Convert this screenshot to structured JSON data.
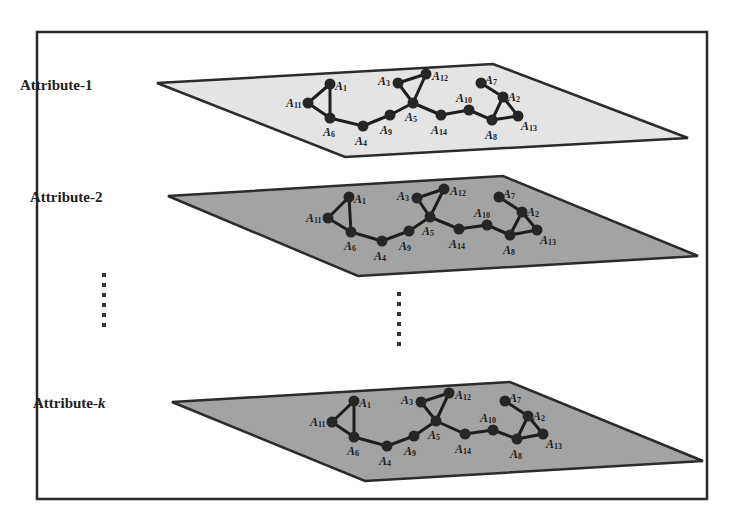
{
  "diagram": {
    "frame": {
      "x": 37,
      "y": 32,
      "w": 670,
      "h": 467
    },
    "colors": {
      "frame_stroke": "#2a2a2a",
      "plane_light": "#e4e4e4",
      "plane_dark": "#a3a3a3",
      "node": "#262626",
      "edge": "#1e1e1e"
    },
    "edges": [
      [
        "A1",
        "A11"
      ],
      [
        "A1",
        "A6"
      ],
      [
        "A11",
        "A6"
      ],
      [
        "A6",
        "A4"
      ],
      [
        "A4",
        "A9"
      ],
      [
        "A9",
        "A5"
      ],
      [
        "A3",
        "A12"
      ],
      [
        "A3",
        "A5"
      ],
      [
        "A12",
        "A5"
      ],
      [
        "A5",
        "A14"
      ],
      [
        "A14",
        "A10"
      ],
      [
        "A10",
        "A8"
      ],
      [
        "A7",
        "A2"
      ],
      [
        "A2",
        "A8"
      ],
      [
        "A2",
        "A13"
      ],
      [
        "A8",
        "A13"
      ]
    ],
    "layers": [
      {
        "label": "Attribute-",
        "label_suffix": "1",
        "label_suffix_italic": false,
        "label_pos": [
          20,
          90
        ],
        "fill": "#e4e4e4",
        "corners": [
          [
            157,
            83
          ],
          [
            493,
            64
          ],
          [
            688,
            138
          ],
          [
            345,
            157
          ]
        ],
        "nodes": {
          "A1": [
            330,
            84
          ],
          "A11": [
            308,
            103
          ],
          "A6": [
            330,
            118
          ],
          "A4": [
            363,
            126
          ],
          "A9": [
            390,
            115
          ],
          "A5": [
            413,
            103
          ],
          "A3": [
            398,
            83
          ],
          "A12": [
            426,
            74
          ],
          "A14": [
            441,
            115
          ],
          "A10": [
            469,
            110
          ],
          "A8": [
            492,
            120
          ],
          "A13": [
            518,
            116
          ],
          "A2": [
            503,
            97
          ],
          "A7": [
            481,
            83
          ]
        }
      },
      {
        "label": "Attribute-",
        "label_suffix": "2",
        "label_suffix_italic": false,
        "label_pos": [
          30,
          202
        ],
        "fill": "#a3a3a3",
        "corners": [
          [
            168,
            196
          ],
          [
            503,
            176
          ],
          [
            698,
            256
          ],
          [
            358,
            276
          ]
        ],
        "nodes": {
          "A1": [
            349,
            197
          ],
          "A11": [
            328,
            218
          ],
          "A6": [
            351,
            232
          ],
          "A4": [
            382,
            241
          ],
          "A9": [
            409,
            231
          ],
          "A5": [
            430,
            217
          ],
          "A3": [
            417,
            198
          ],
          "A12": [
            444,
            189
          ],
          "A14": [
            459,
            229
          ],
          "A10": [
            487,
            225
          ],
          "A8": [
            510,
            235
          ],
          "A13": [
            537,
            230
          ],
          "A2": [
            522,
            212
          ],
          "A7": [
            499,
            197
          ]
        }
      },
      {
        "label": "Attribute-",
        "label_suffix": "k",
        "label_suffix_italic": true,
        "label_pos": [
          33,
          408
        ],
        "fill": "#a3a3a3",
        "corners": [
          [
            172,
            402
          ],
          [
            510,
            382
          ],
          [
            703,
            461
          ],
          [
            365,
            481
          ]
        ],
        "nodes": {
          "A1": [
            354,
            401
          ],
          "A11": [
            332,
            422
          ],
          "A6": [
            354,
            437
          ],
          "A4": [
            387,
            446
          ],
          "A9": [
            414,
            436
          ],
          "A5": [
            436,
            421
          ],
          "A3": [
            421,
            402
          ],
          "A12": [
            449,
            393
          ],
          "A14": [
            465,
            434
          ],
          "A10": [
            493,
            430
          ],
          "A8": [
            517,
            439
          ],
          "A13": [
            543,
            434
          ],
          "A2": [
            528,
            416
          ],
          "A7": [
            505,
            401
          ]
        }
      }
    ],
    "node_label_offsets": {
      "A1": [
        5,
        6
      ],
      "A11": [
        -22,
        4
      ],
      "A6": [
        -7,
        18
      ],
      "A4": [
        -8,
        19
      ],
      "A9": [
        -10,
        19
      ],
      "A5": [
        -8,
        18
      ],
      "A3": [
        -20,
        2
      ],
      "A12": [
        6,
        6
      ],
      "A14": [
        -10,
        19
      ],
      "A10": [
        -13,
        -8
      ],
      "A8": [
        -7,
        19
      ],
      "A13": [
        3,
        14
      ],
      "A2": [
        5,
        4
      ],
      "A7": [
        4,
        1
      ]
    },
    "ellipsis": [
      {
        "x": 104,
        "y_start": 275,
        "count": 6,
        "spacing": 10
      },
      {
        "x": 399,
        "y_start": 294,
        "count": 6,
        "spacing": 10
      }
    ]
  }
}
